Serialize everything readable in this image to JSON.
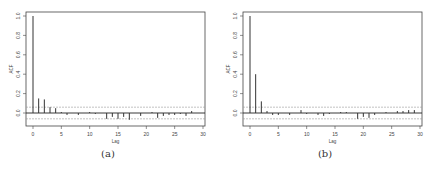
{
  "chart_data": [
    {
      "type": "bar",
      "subtype": "acf-correlogram",
      "caption": "(a)",
      "title": "",
      "xlabel": "Lag",
      "ylabel": "ACF",
      "xlim": [
        0,
        30
      ],
      "ylim": [
        -0.1,
        1.0
      ],
      "xticks": [
        "0",
        "5",
        "10",
        "15",
        "20",
        "25",
        "30"
      ],
      "yticks": [
        "0.0",
        "0.2",
        "0.4",
        "0.6",
        "0.8",
        "1.0"
      ],
      "confidence_band": [
        0.06,
        -0.06
      ],
      "grid": false,
      "x": [
        0,
        1,
        2,
        3,
        4,
        5,
        6,
        7,
        8,
        9,
        10,
        11,
        12,
        13,
        14,
        15,
        16,
        17,
        18,
        19,
        20,
        21,
        22,
        23,
        24,
        25,
        26,
        27,
        28,
        29,
        30
      ],
      "values": [
        1.0,
        0.15,
        0.14,
        0.06,
        0.05,
        0.01,
        -0.02,
        0.0,
        -0.02,
        0.0,
        0.01,
        -0.01,
        0.0,
        -0.06,
        -0.04,
        -0.06,
        -0.04,
        -0.07,
        0.0,
        -0.03,
        0.0,
        0.01,
        -0.05,
        -0.03,
        -0.02,
        -0.02,
        -0.01,
        -0.03,
        0.02,
        0.0,
        0.0
      ]
    },
    {
      "type": "bar",
      "subtype": "acf-correlogram",
      "caption": "(b)",
      "title": "",
      "xlabel": "Lag",
      "ylabel": "ACF",
      "xlim": [
        0,
        30
      ],
      "ylim": [
        -0.1,
        1.0
      ],
      "xticks": [
        "0",
        "5",
        "10",
        "15",
        "20",
        "25",
        "30"
      ],
      "yticks": [
        "0.0",
        "0.2",
        "0.4",
        "0.6",
        "0.8",
        "1.0"
      ],
      "confidence_band": [
        0.06,
        -0.06
      ],
      "grid": false,
      "x": [
        0,
        1,
        2,
        3,
        4,
        5,
        6,
        7,
        8,
        9,
        10,
        11,
        12,
        13,
        14,
        15,
        16,
        17,
        18,
        19,
        20,
        21,
        22,
        23,
        24,
        25,
        26,
        27,
        28,
        29,
        30
      ],
      "values": [
        1.0,
        0.4,
        0.12,
        0.02,
        -0.02,
        -0.02,
        0.0,
        -0.02,
        0.0,
        0.03,
        -0.01,
        0.0,
        -0.02,
        -0.03,
        -0.01,
        0.0,
        0.01,
        0.01,
        0.0,
        -0.06,
        -0.04,
        -0.05,
        -0.02,
        0.0,
        0.01,
        0.0,
        0.02,
        0.02,
        0.03,
        0.03,
        0.0
      ]
    }
  ]
}
